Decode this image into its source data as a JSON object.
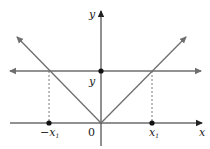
{
  "diagram": {
    "title": "",
    "axes": {
      "x_label": "x",
      "y_label": "y",
      "origin_label": "0"
    },
    "curves": [
      {
        "name": "absolute-value-v",
        "description": "V-shaped graph with vertex at origin",
        "color": "#6e6e6e"
      },
      {
        "name": "horizontal-line",
        "description": "Horizontal line y = y (constant)",
        "color": "#6e6e6e"
      }
    ],
    "points": [
      {
        "name": "y-intercept",
        "label": "y"
      },
      {
        "name": "neg-x1",
        "label": "−x",
        "sub": "1"
      },
      {
        "name": "pos-x1",
        "label": "x",
        "sub": "1"
      }
    ],
    "colors": {
      "axis": "#222222",
      "curve": "#6e6e6e",
      "dashed": "#6e6e6e",
      "point": "#111111"
    }
  }
}
